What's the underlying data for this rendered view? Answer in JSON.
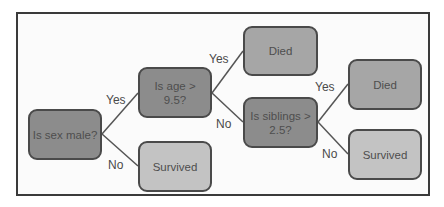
{
  "diagram": {
    "nodes": {
      "root": {
        "text": "Is sex male?",
        "type": "decision"
      },
      "age": {
        "text": "Is age > 9.5?",
        "type": "decision"
      },
      "sex_no": {
        "text": "Survived",
        "type": "leaf"
      },
      "age_yes": {
        "text": "Died",
        "type": "leaf"
      },
      "siblings": {
        "text": "Is siblings > 2.5?",
        "type": "decision"
      },
      "sib_yes": {
        "text": "Died",
        "type": "leaf"
      },
      "sib_no": {
        "text": "Survived",
        "type": "leaf"
      }
    },
    "edges": {
      "root_yes": "Yes",
      "root_no": "No",
      "age_yes": "Yes",
      "age_no": "No",
      "sib_yes": "Yes",
      "sib_no": "No"
    },
    "colors": {
      "decision": "#8c8c8c",
      "died": "#a6a6a6",
      "survived": "#c3c3c3",
      "border": "#4a4a4a"
    }
  }
}
